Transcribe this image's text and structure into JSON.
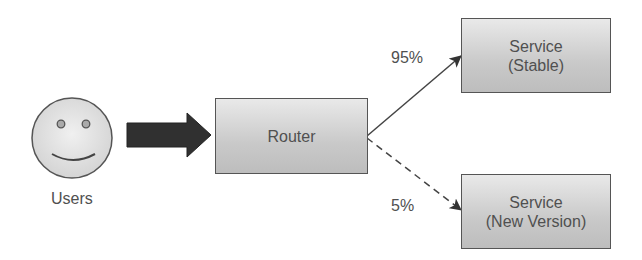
{
  "diagram": {
    "type": "canary-release-routing",
    "nodes": {
      "users": {
        "label": "Users",
        "icon": "smiley-face-icon"
      },
      "router": {
        "label": "Router"
      },
      "stable": {
        "line1": "Service",
        "line2": "(Stable)"
      },
      "canary": {
        "line1": "Service",
        "line2": "(New Version)"
      }
    },
    "edges": {
      "users_to_router": {
        "style": "thick-arrow"
      },
      "router_to_stable": {
        "label": "95%",
        "style": "solid"
      },
      "router_to_canary": {
        "label": "5%",
        "style": "dashed"
      }
    },
    "colors": {
      "box_fill_top": "#e9e9e9",
      "box_fill_bottom": "#bdbdbd",
      "border": "#555555",
      "arrow": "#333333",
      "text": "#505050"
    }
  }
}
